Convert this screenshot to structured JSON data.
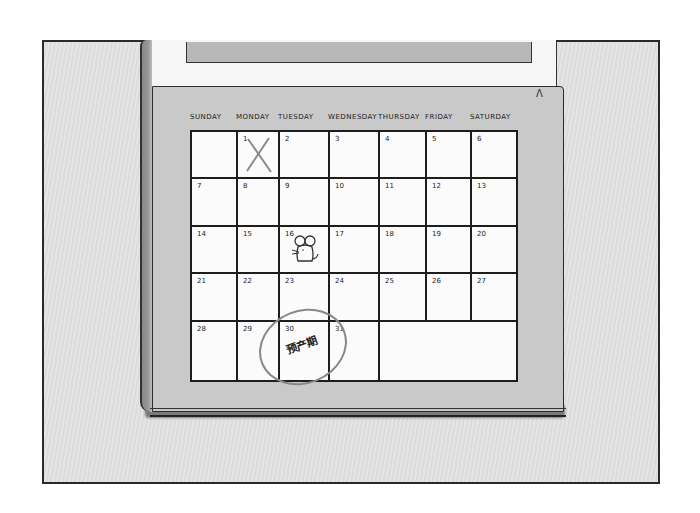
{
  "illustration": {
    "subject": "wall calendar sketch",
    "corner_mark": "Λ",
    "weekdays": [
      "SUNDAY",
      "MONDAY",
      "TUESDAY",
      "WEDNESDAY",
      "THURSDAY",
      "FRIDAY",
      "SATURDAY"
    ],
    "weeks": [
      [
        "",
        "1",
        "2",
        "3",
        "4",
        "5",
        "6"
      ],
      [
        "7",
        "8",
        "9",
        "10",
        "11",
        "12",
        "13"
      ],
      [
        "14",
        "15",
        "16",
        "17",
        "18",
        "19",
        "20"
      ],
      [
        "21",
        "22",
        "23",
        "24",
        "25",
        "26",
        "27"
      ],
      [
        "28",
        "29",
        "30",
        "31"
      ]
    ],
    "marks": {
      "day_1": "crossed-out-x",
      "day_16": "mouse-doodle",
      "day_30": "circled"
    },
    "note": "预产期",
    "colors": {
      "background": "#dcdcdc",
      "page": "#c9c9c9",
      "grid": "#fbfbfb",
      "ink": "#1d1d1d",
      "circle": "#888888"
    }
  }
}
